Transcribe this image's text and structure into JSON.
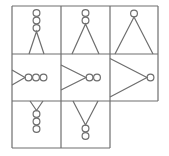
{
  "puzzle": {
    "title": "",
    "grid": {
      "rows": 3,
      "cols": 3
    },
    "line_color": "#6e6e6e",
    "stroke_width": 1.2,
    "cells": [
      {
        "row": 0,
        "col": 0,
        "orientation": "up",
        "circles": 3,
        "triangle_size": "small",
        "present": true
      },
      {
        "row": 0,
        "col": 1,
        "orientation": "up",
        "circles": 2,
        "triangle_size": "medium",
        "present": true
      },
      {
        "row": 0,
        "col": 2,
        "orientation": "up",
        "circles": 1,
        "triangle_size": "large",
        "present": true
      },
      {
        "row": 1,
        "col": 0,
        "orientation": "right",
        "circles": 3,
        "triangle_size": "small",
        "present": true
      },
      {
        "row": 1,
        "col": 1,
        "orientation": "right",
        "circles": 2,
        "triangle_size": "medium",
        "present": true
      },
      {
        "row": 1,
        "col": 2,
        "orientation": "right",
        "circles": 1,
        "triangle_size": "large",
        "present": true
      },
      {
        "row": 2,
        "col": 0,
        "orientation": "down",
        "circles": 3,
        "triangle_size": "small",
        "present": true
      },
      {
        "row": 2,
        "col": 1,
        "orientation": "down",
        "circles": 2,
        "triangle_size": "medium",
        "present": true
      },
      {
        "row": 2,
        "col": 2,
        "orientation": "down",
        "circles": 1,
        "triangle_size": "large",
        "present": false
      }
    ]
  }
}
